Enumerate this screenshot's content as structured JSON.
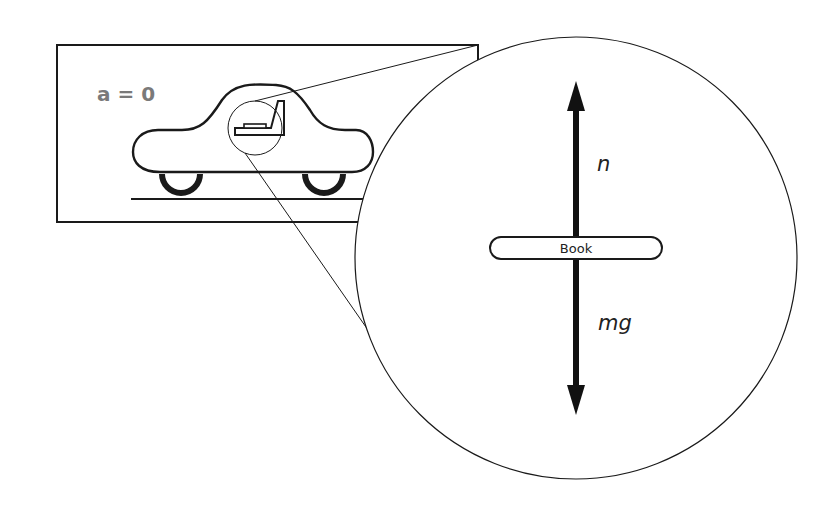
{
  "diagram": {
    "type": "free-body diagram",
    "acceleration_label": "a = 0",
    "scene": {
      "frame": "car at rest on ground",
      "magnified_object": "book on car seat"
    },
    "inset": {
      "object_label": "Book",
      "forces": [
        {
          "label": "n",
          "direction": "up",
          "meaning": "normal force"
        },
        {
          "label": "mg",
          "direction": "down",
          "meaning": "weight"
        }
      ]
    },
    "colors": {
      "stroke": "#1a1a1a",
      "accel_label": "#7a7a7a",
      "background": "#ffffff"
    }
  }
}
